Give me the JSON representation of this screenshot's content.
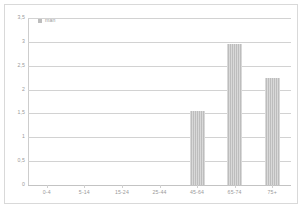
{
  "chart_data": {
    "type": "bar",
    "title": "",
    "subtitle": "",
    "xlabel": "",
    "ylabel": "",
    "categories": [
      "0-4",
      "5-14",
      "15-24",
      "25-44",
      "45-64",
      "65-74",
      "75+"
    ],
    "series": [
      {
        "name": "man",
        "values": [
          0,
          0,
          0,
          0,
          1.55,
          2.95,
          2.25
        ]
      }
    ],
    "ylim": [
      0,
      3.5
    ],
    "yticks": [
      0,
      0.5,
      1,
      1.5,
      2,
      2.5,
      3,
      3.5
    ],
    "ytick_labels": [
      "0",
      "0,5",
      "1",
      "1,5",
      "2",
      "2,5",
      "3",
      "3,5"
    ],
    "grid": true,
    "legend_position": "top-left",
    "legend_entries": [
      "man"
    ],
    "bar_color": "#bdbdbd",
    "grid_color": "#d2d2d2",
    "axis_color": "#cdcdcd",
    "text_color": "#9a9a9a",
    "frame_color": "#d9d9d9",
    "background": "#ffffff"
  },
  "legend": {
    "label": "man"
  }
}
